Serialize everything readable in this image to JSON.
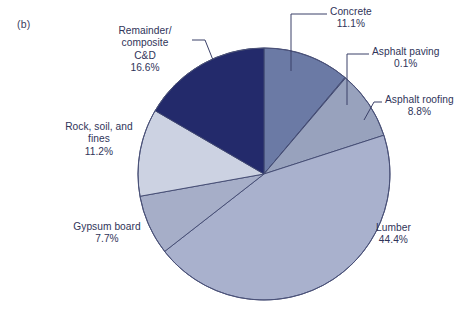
{
  "figure": {
    "panel_label": "(b)"
  },
  "chart_data": {
    "type": "pie",
    "title": "",
    "xlabel": "",
    "ylabel": "",
    "legend_position": "callout-labels",
    "grid": false,
    "units": "percent",
    "total": 99.9,
    "start_angle_deg": 0,
    "direction": "clockwise",
    "center_px": [
      264,
      174
    ],
    "radius_px": 126,
    "categories": [
      "Concrete",
      "Asphalt paving",
      "Asphalt roofing",
      "Lumber",
      "Gypsum board",
      "Rock, soil, and fines",
      "Remainder/composite C&D"
    ],
    "values": [
      11.1,
      0.1,
      8.8,
      44.4,
      7.7,
      11.2,
      16.6
    ],
    "colors": [
      "#6b7aa5",
      "#8a94b4",
      "#98a2bd",
      "#a9b1cd",
      "#a6aec8",
      "#ccd2e2",
      "#232a6b"
    ],
    "slices": [
      {
        "label": "Concrete",
        "value": 11.1,
        "pct_text": "11.1%",
        "color": "#6b7aa5"
      },
      {
        "label": "Asphalt paving",
        "value": 0.1,
        "pct_text": "0.1%",
        "color": "#8a94b4"
      },
      {
        "label": "Asphalt roofing",
        "value": 8.8,
        "pct_text": "8.8%",
        "color": "#98a2bd"
      },
      {
        "label": "Lumber",
        "value": 44.4,
        "pct_text": "44.4%",
        "color": "#a9b1cd"
      },
      {
        "label": "Gypsum board",
        "value": 7.7,
        "pct_text": "7.7%",
        "color": "#a6aec8"
      },
      {
        "label": "Rock, soil, and fines",
        "value": 11.2,
        "pct_text": "11.2%",
        "color": "#ccd2e2"
      },
      {
        "label": "Remainder/composite C&D",
        "value": 16.6,
        "pct_text": "16.6%",
        "color": "#232a6b"
      }
    ]
  },
  "labels": {
    "concrete": {
      "name": "Concrete",
      "pct": "11.1%"
    },
    "asphalt_paving": {
      "name": "Asphalt paving",
      "pct": "0.1%"
    },
    "asphalt_roofing": {
      "name": "Asphalt roofing",
      "pct": "8.8%"
    },
    "lumber": {
      "name": "Lumber",
      "pct": "44.4%"
    },
    "gypsum": {
      "name": "Gypsum board",
      "pct": "7.7%"
    },
    "rock": {
      "line1": "Rock, soil, and",
      "line2": "fines",
      "pct": "11.2%"
    },
    "remainder": {
      "line1": "Remainder/",
      "line2": "composite",
      "line3": "C&D",
      "pct": "16.6%"
    }
  },
  "style": {
    "text_color": "#2f3459",
    "leader_color": "#3a4068",
    "slice_edge": "#424a72",
    "background": "#ffffff"
  }
}
